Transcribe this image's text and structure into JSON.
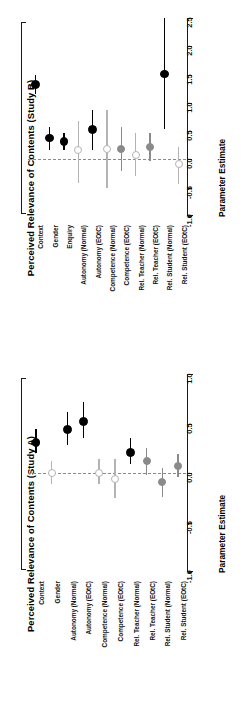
{
  "figure": {
    "axis_caption": "Parameter Estimate"
  },
  "chart_data": [
    {
      "type": "scatter",
      "panel_id": "study-b",
      "title": "Perceived Relevance of Contents (Study B)",
      "xlabel": "",
      "ylabel": "Parameter Estimate",
      "orientation": "vertical-errorbars",
      "ylim": [
        -1.0,
        2.5
      ],
      "yticks": [
        -1.0,
        -0.5,
        0.0,
        0.5,
        1.0,
        1.5,
        2.0,
        2.5
      ],
      "ytick_labels": [
        "-1.0",
        "-0.5",
        "0.0",
        "0.5",
        "1.0",
        "1.5",
        "2.0",
        "2.5"
      ],
      "grid": false,
      "reference_line": 0.0,
      "legend": "none",
      "categories": [
        "Context",
        "Gender",
        "Enquiry",
        "Autonomy (Normal)",
        "Autonomy (EOtC)",
        "Competence (Normal)",
        "Competence (EOtC)",
        "Rel. Teacher (Normal)",
        "Rel. Teacher (EOtC)",
        "Rel. Student (Normal)",
        "Rel. Student (EOtC)"
      ],
      "values": [
        1.33,
        0.38,
        0.31,
        0.16,
        0.53,
        0.19,
        0.19,
        0.08,
        0.22,
        1.51,
        -0.08
      ],
      "ci_low": [
        1.16,
        0.17,
        0.16,
        -0.42,
        0.17,
        -0.5,
        -0.2,
        -0.3,
        -0.02,
        0.53,
        -0.44
      ],
      "ci_high": [
        1.5,
        0.58,
        0.46,
        0.68,
        0.88,
        0.88,
        0.58,
        0.47,
        0.46,
        2.5,
        0.22
      ],
      "marker_styles": [
        "filled-black",
        "filled-black",
        "filled-black",
        "open",
        "filled-black",
        "open",
        "filled-gray",
        "open",
        "filled-gray",
        "filled-black",
        "open"
      ],
      "significant": [
        true,
        true,
        true,
        false,
        true,
        false,
        false,
        false,
        false,
        true,
        false
      ]
    },
    {
      "type": "scatter",
      "panel_id": "study-a",
      "title": "Perceived Relevance of Contents (Study A)",
      "xlabel": "",
      "ylabel": "Parameter Estimate",
      "orientation": "vertical-errorbars",
      "ylim": [
        -1.0,
        1.0
      ],
      "yticks": [
        -1.0,
        -0.5,
        0.0,
        0.5,
        1.0
      ],
      "ytick_labels": [
        "-1.0",
        "-0.5",
        "0.0",
        "0.5",
        "1.0"
      ],
      "grid": false,
      "reference_line": 0.0,
      "legend": "none",
      "categories": [
        "Context",
        "Gender",
        "Autonomy (Normal)",
        "Autonomy (EOtC)",
        "Competence (Normal)",
        "Competence (EOtC)",
        "Rel. Teacher (Normal)",
        "Rel. Teacher (EOtC)",
        "Rel. Student (Normal)",
        "Rel. Student (EOtC)"
      ],
      "values": [
        0.31,
        0.0,
        0.44,
        0.52,
        0.0,
        -0.06,
        0.21,
        0.12,
        -0.09,
        0.07
      ],
      "ci_low": [
        0.2,
        -0.11,
        0.28,
        0.35,
        -0.11,
        -0.25,
        0.09,
        -0.02,
        -0.24,
        -0.04
      ],
      "ci_high": [
        0.44,
        0.12,
        0.62,
        0.72,
        0.14,
        0.14,
        0.35,
        0.25,
        0.05,
        0.19
      ],
      "marker_styles": [
        "filled-black",
        "open",
        "filled-black",
        "filled-black",
        "open",
        "open",
        "filled-black",
        "filled-gray",
        "filled-gray",
        "filled-gray"
      ],
      "significant": [
        true,
        false,
        true,
        true,
        false,
        false,
        true,
        false,
        false,
        false
      ]
    }
  ],
  "colors": {
    "significant": "#000000",
    "nonsignificant_gray": "#8a8a8a",
    "nonsignificant_light": "#b3b3b3",
    "open_marker_fill": "#ffffff",
    "reference_line": "#8a8a8a",
    "axis": "#1a1a1a",
    "background": "#ffffff"
  }
}
